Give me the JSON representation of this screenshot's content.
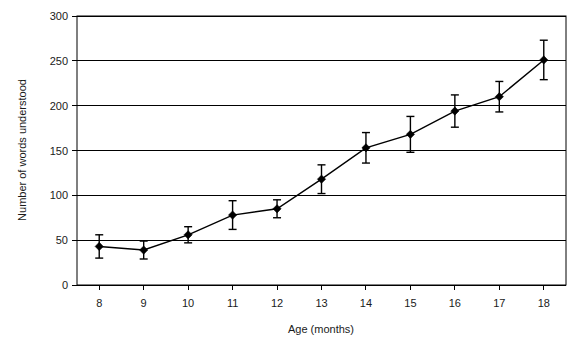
{
  "chart_data": {
    "type": "line",
    "title": "",
    "xlabel": "Age (months)",
    "ylabel": "Number of words understood",
    "x": [
      8,
      9,
      10,
      11,
      12,
      13,
      14,
      15,
      16,
      17,
      18
    ],
    "categories": [
      "8",
      "9",
      "10",
      "11",
      "12",
      "13",
      "14",
      "15",
      "16",
      "17",
      "18"
    ],
    "values": [
      43,
      39,
      56,
      78,
      85,
      118,
      153,
      168,
      194,
      210,
      251
    ],
    "errors": [
      13,
      10,
      9,
      16,
      10,
      16,
      17,
      20,
      18,
      17,
      22
    ],
    "series": [
      {
        "name": "Number of words understood",
        "values": [
          43,
          39,
          56,
          78,
          85,
          118,
          153,
          168,
          194,
          210,
          251
        ],
        "errors": [
          13,
          10,
          9,
          16,
          10,
          16,
          17,
          20,
          18,
          17,
          22
        ]
      }
    ],
    "xlim": [
      7.5,
      18.5
    ],
    "ylim": [
      0,
      300
    ],
    "ytick_labels": [
      "0",
      "50",
      "100",
      "150",
      "200",
      "250",
      "300"
    ],
    "yticks": [
      0,
      50,
      100,
      150,
      200,
      250,
      300
    ],
    "xtick_labels": [
      "8",
      "9",
      "10",
      "11",
      "12",
      "13",
      "14",
      "15",
      "16",
      "17",
      "18"
    ],
    "grid": "horizontal",
    "legend": "none",
    "marker_style": "filled-diamond",
    "error_bar_style": "capped",
    "line_color": "#000000",
    "marker_color": "#000000",
    "grid_color": "#000000",
    "background_color": "#ffffff"
  },
  "axes": {
    "y_axis_title": "Number of words understood",
    "x_axis_title": "Age (months)"
  }
}
